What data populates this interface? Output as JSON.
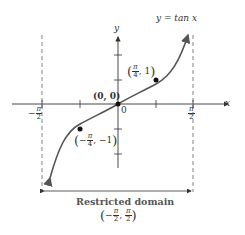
{
  "diagram": {
    "function_label": "y = tan x",
    "axis_x_label": "x",
    "axis_y_label": "y",
    "origin_label": "0",
    "origin_point_label": "(0, 0)",
    "point_positive": {
      "num": "π",
      "den": "4",
      "y": "1",
      "sign": ""
    },
    "point_negative": {
      "num": "π",
      "den": "4",
      "y": "−1",
      "sign": "−"
    },
    "asymptote_left": {
      "sign": "−",
      "num": "π",
      "den": "2"
    },
    "asymptote_right": {
      "num": "π",
      "den": "2"
    },
    "domain_title": "Restricted domain",
    "domain_interval": {
      "left_sign": "−",
      "num": "π",
      "den": "2"
    },
    "colors": {
      "curve": "#555555",
      "axes": "#333333",
      "points": "#111111",
      "dashed": "#666666"
    }
  }
}
